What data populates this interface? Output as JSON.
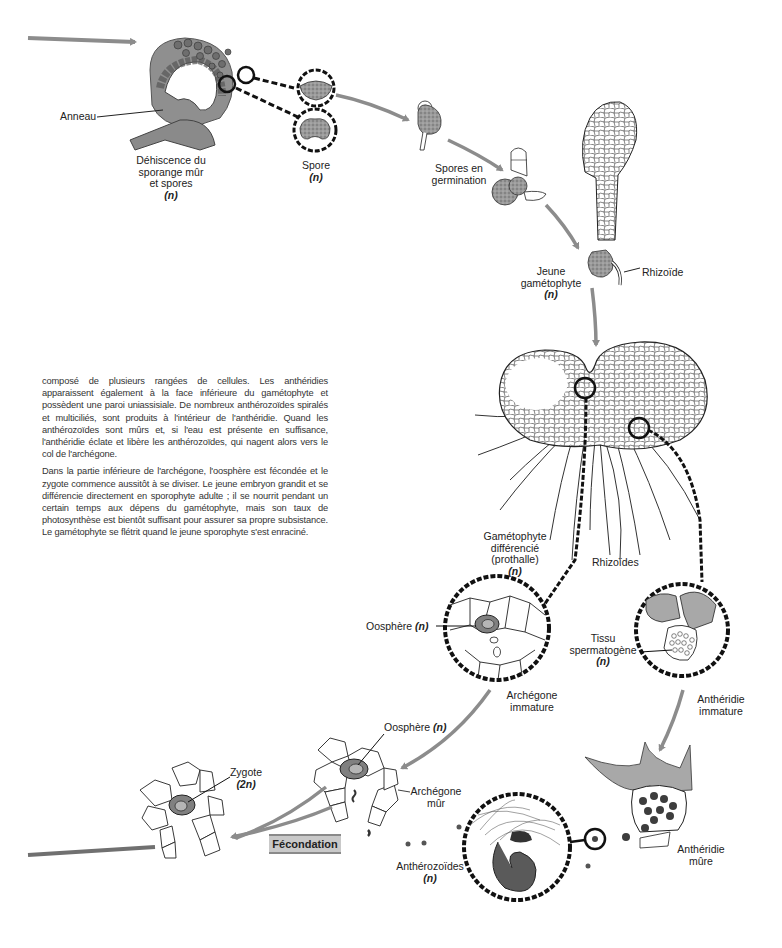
{
  "diagram": {
    "colors": {
      "arrow": "#8c8c8c",
      "cell_fill_dark": "#7d7d7d",
      "cell_fill_light": "#b5b5b5",
      "dashed_link": "#111111",
      "fecondation_box": "#c9c9c9"
    },
    "labels": {
      "anneau": "Anneau",
      "dehiscence": [
        "Déhiscence du",
        "sporange mûr",
        "et spores"
      ],
      "dehiscence_ploidy": "(n)",
      "spore": "Spore",
      "spore_ploidy": "(n)",
      "spores_germination": [
        "Spores en",
        "germination"
      ],
      "jeune_gametophyte": [
        "Jeune",
        "gamétophyte"
      ],
      "jeune_gametophyte_ploidy": "(n)",
      "rhizoide": "Rhizoïde",
      "gametophyte_differencie": [
        "Gamétophyte",
        "différencié",
        "(prothalle)"
      ],
      "gametophyte_differencie_ploidy": "(n)",
      "rhizoides": "Rhizoïdes",
      "oosphere_1": "Oosphère",
      "oosphere_1_ploidy": "(n)",
      "archegone_immature": [
        "Archégone",
        "immature"
      ],
      "tissu_spermatogene": [
        "Tissu",
        "spermatogène"
      ],
      "tissu_spermatogene_ploidy": "(n)",
      "antheridie_immature": [
        "Anthéridie",
        "immature"
      ],
      "oosphere_2": "Oosphère",
      "oosphere_2_ploidy": "(n)",
      "archegone_mur": [
        "Archégone",
        "mûr"
      ],
      "zygote": "Zygote",
      "zygote_ploidy": "(2n)",
      "fecondation": "Fécondation",
      "antherozoides": "Anthérozoïdes",
      "antherozoides_ploidy": "(n)",
      "antheridie_mure": [
        "Anthéridie",
        "mûre"
      ]
    }
  },
  "text": {
    "paragraphs": [
      "composé de plusieurs rangées de cellules. Les anthéridies apparaissent également à la face inférieure du gamétophyte et possèdent une paroi uniassisiale. De nombreux anthérozoïdes spiralés et multiciliés, sont produits à l'intérieur de l'anthéridie. Quand les anthérozoïdes sont mûrs et, si l'eau est présente en suffisance, l'anthéridie éclate et libère les anthérozoïdes, qui nagent alors vers le col de l'archégone.",
      "Dans la partie inférieure de l'archégone, l'oosphère est fécondée et le zygote commence aussitôt à se diviser. Le jeune embryon grandit et se différencie directement en sporophyte adulte ; il se nourrit pendant un certain temps aux dépens du gamétophyte, mais son taux de photosynthèse est bientôt suffisant pour assurer sa propre subsistance. Le gamétophyte se flétrit quand le jeune sporophyte s'est enraciné."
    ]
  }
}
